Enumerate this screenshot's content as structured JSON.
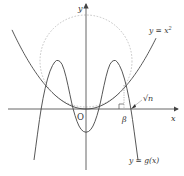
{
  "diagram": {
    "labels": {
      "y_axis": "y",
      "x_axis": "x",
      "origin": "O",
      "parabola": "y = x",
      "parabola_exp": "2",
      "g_curve": "y = g(x)",
      "beta": "β",
      "sqrt_n": "√n"
    },
    "colors": {
      "curve": "#444444",
      "axis": "#555555",
      "circle": "#b5b5b5",
      "text": "#333333"
    }
  }
}
